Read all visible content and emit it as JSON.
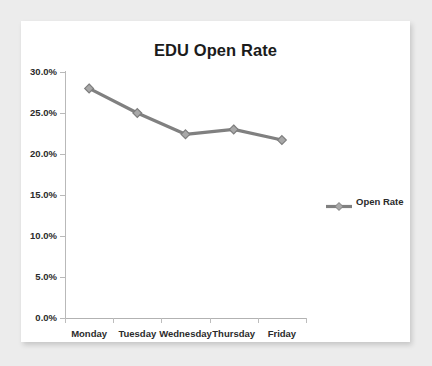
{
  "chart_data": {
    "type": "line",
    "title": "EDU Open Rate",
    "xlabel": "",
    "ylabel": "",
    "categories": [
      "Monday",
      "Tuesday",
      "Wednesday",
      "Thursday",
      "Friday"
    ],
    "series": [
      {
        "name": "Open Rate",
        "values": [
          28.0,
          25.0,
          22.4,
          23.0,
          21.7
        ]
      }
    ],
    "ylim": [
      0.0,
      30.0
    ],
    "ytick_values": [
      0.0,
      5.0,
      10.0,
      15.0,
      20.0,
      25.0,
      30.0
    ],
    "ytick_labels": [
      "0.0%",
      "5.0%",
      "10.0%",
      "15.0%",
      "20.0%",
      "25.0%",
      "30.0%"
    ],
    "grid": false,
    "legend_position": "right",
    "series_color": "#808080",
    "marker": "diamond",
    "axis_color": "#b9b9b9",
    "text_color": "#2b2b2b",
    "plot_background": "#ffffff",
    "page_background": "#ececec"
  }
}
